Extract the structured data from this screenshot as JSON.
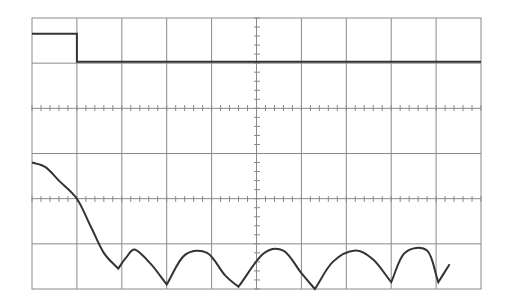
{
  "chart_data": {
    "type": "line",
    "title": "",
    "xlabel": "",
    "ylabel": "",
    "grid": true,
    "grid_divisions": {
      "horizontal": 10,
      "vertical": 6
    },
    "minor_ticks_per_division": 5,
    "plot_area_px": {
      "left": 32,
      "top": 18,
      "right": 481,
      "bottom": 289
    },
    "axis_tick_lines": [
      {
        "orientation": "horizontal",
        "y_px": 108
      },
      {
        "orientation": "horizontal",
        "y_px": 199
      },
      {
        "orientation": "vertical",
        "x_px": 257
      }
    ],
    "xlim": [
      0,
      10
    ],
    "ylim": [
      0,
      6
    ],
    "series": [
      {
        "name": "rectangular-pulse",
        "color": "#333333",
        "x": [
          0,
          1.0,
          1.0,
          10
        ],
        "y": [
          5.65,
          5.65,
          5.03,
          5.03
        ]
      },
      {
        "name": "sinc-magnitude-spectrum",
        "color": "#333333",
        "x": [
          0,
          0.3,
          0.6,
          1.0,
          1.3,
          1.6,
          1.92,
          2.1,
          2.3,
          2.65,
          3.0,
          3.4,
          3.9,
          4.3,
          4.6,
          5.15,
          5.6,
          6.0,
          6.3,
          6.7,
          7.2,
          7.6,
          8.0,
          8.3,
          8.8,
          9.05,
          9.3
        ],
        "y": [
          2.8,
          2.7,
          2.4,
          2.0,
          1.4,
          0.8,
          0.45,
          0.7,
          0.87,
          0.55,
          0.1,
          0.75,
          0.8,
          0.3,
          0.05,
          0.78,
          0.85,
          0.35,
          0.0,
          0.6,
          0.85,
          0.65,
          0.15,
          0.8,
          0.85,
          0.15,
          0.55
        ]
      }
    ],
    "colors": {
      "background": "#ffffff",
      "grid": "#8a8a8a",
      "trace": "#333333"
    }
  }
}
